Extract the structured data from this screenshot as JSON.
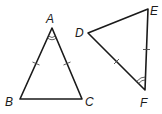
{
  "diagram": {
    "colors": {
      "stroke": "#1a1a1a",
      "background": "#ffffff"
    },
    "triangles": [
      {
        "name": "triangle-ABC",
        "vertices": {
          "A": {
            "label": "A",
            "x": 52,
            "y": 28
          },
          "B": {
            "label": "B",
            "x": 20,
            "y": 99
          },
          "C": {
            "label": "C",
            "x": 82,
            "y": 99
          }
        },
        "congruent_sides": [
          "AB",
          "AC"
        ],
        "tick_marks": 1,
        "angle_mark": {
          "vertex": "A",
          "arcs": 2
        }
      },
      {
        "name": "triangle-DEF",
        "vertices": {
          "D": {
            "label": "D",
            "x": 88,
            "y": 33
          },
          "E": {
            "label": "E",
            "x": 148,
            "y": 9
          },
          "F": {
            "label": "F",
            "x": 145,
            "y": 90
          }
        },
        "congruent_sides": [
          "DF",
          "EF"
        ],
        "tick_marks": 1,
        "angle_mark": {
          "vertex": "F",
          "arcs": 2
        }
      }
    ],
    "labels": {
      "A": "A",
      "B": "B",
      "C": "C",
      "D": "D",
      "E": "E",
      "F": "F"
    }
  }
}
